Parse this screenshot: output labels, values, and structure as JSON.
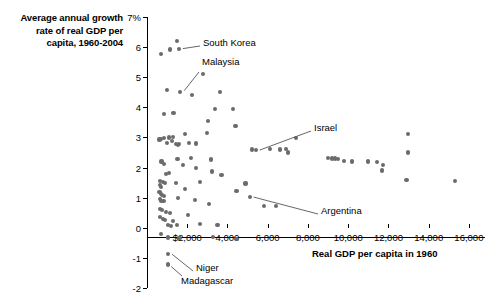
{
  "title": {
    "line1": "Average annual growth",
    "line2": "rate of real GDP per",
    "line3": "capita, 1960-2004"
  },
  "chart_data": {
    "type": "scatter",
    "title": "Average annual growth rate of real GDP per capita, 1960-2004",
    "xlabel": "Real GDP per capita in 1960",
    "ylabel": "Average annual growth rate of real GDP per capita, 1960-2004",
    "xlim": [
      0,
      16800
    ],
    "ylim": [
      -2,
      7
    ],
    "grid": false,
    "legend": null,
    "x_ticks": [
      2000,
      4000,
      6000,
      8000,
      10000,
      12000,
      14000,
      16000
    ],
    "x_tick_labels": [
      "$2,000",
      "4,000",
      "6,000",
      "8,000",
      "10,000",
      "12,000",
      "14,000",
      "16,000"
    ],
    "y_ticks": [
      -2,
      -1,
      0,
      1,
      2,
      3,
      4,
      5,
      6,
      7
    ],
    "y_tick_labels": [
      "-2",
      "-1",
      "0",
      "1",
      "2",
      "3",
      "4",
      "5",
      "6",
      "7%"
    ],
    "points": [
      {
        "x": 1500,
        "y": 6.2
      },
      {
        "x": 1580,
        "y": 5.95
      },
      {
        "x": 1160,
        "y": 5.92
      },
      {
        "x": 700,
        "y": 5.78
      },
      {
        "x": 2780,
        "y": 5.1
      },
      {
        "x": 3640,
        "y": 4.52
      },
      {
        "x": 1650,
        "y": 4.52
      },
      {
        "x": 1010,
        "y": 4.57
      },
      {
        "x": 2240,
        "y": 4.4
      },
      {
        "x": 4280,
        "y": 3.95
      },
      {
        "x": 3400,
        "y": 3.95
      },
      {
        "x": 1320,
        "y": 3.8
      },
      {
        "x": 860,
        "y": 3.77
      },
      {
        "x": 3050,
        "y": 3.55
      },
      {
        "x": 4400,
        "y": 3.38
      },
      {
        "x": 12980,
        "y": 3.12
      },
      {
        "x": 3000,
        "y": 3.14
      },
      {
        "x": 1900,
        "y": 3.12
      },
      {
        "x": 1080,
        "y": 3.0
      },
      {
        "x": 840,
        "y": 2.98
      },
      {
        "x": 700,
        "y": 2.95
      },
      {
        "x": 620,
        "y": 2.93
      },
      {
        "x": 1310,
        "y": 3.02
      },
      {
        "x": 1240,
        "y": 2.88
      },
      {
        "x": 1010,
        "y": 2.82
      },
      {
        "x": 1450,
        "y": 2.78
      },
      {
        "x": 1560,
        "y": 2.74
      },
      {
        "x": 1580,
        "y": 2.78
      },
      {
        "x": 2100,
        "y": 2.82
      },
      {
        "x": 2430,
        "y": 2.8
      },
      {
        "x": 12970,
        "y": 2.5
      },
      {
        "x": 7400,
        "y": 2.98
      },
      {
        "x": 6100,
        "y": 2.62
      },
      {
        "x": 6600,
        "y": 2.6
      },
      {
        "x": 6900,
        "y": 2.62
      },
      {
        "x": 7000,
        "y": 2.5
      },
      {
        "x": 5400,
        "y": 2.58
      },
      {
        "x": 5200,
        "y": 2.6
      },
      {
        "x": 9000,
        "y": 2.33
      },
      {
        "x": 9200,
        "y": 2.3
      },
      {
        "x": 9350,
        "y": 2.3
      },
      {
        "x": 9500,
        "y": 2.28
      },
      {
        "x": 9800,
        "y": 2.22
      },
      {
        "x": 10200,
        "y": 2.2
      },
      {
        "x": 11000,
        "y": 2.2
      },
      {
        "x": 11450,
        "y": 2.18
      },
      {
        "x": 11700,
        "y": 1.9
      },
      {
        "x": 11750,
        "y": 2.08
      },
      {
        "x": 15300,
        "y": 1.55
      },
      {
        "x": 12900,
        "y": 1.6
      },
      {
        "x": 2200,
        "y": 2.32
      },
      {
        "x": 3200,
        "y": 2.27
      },
      {
        "x": 1520,
        "y": 2.28
      },
      {
        "x": 720,
        "y": 2.2
      },
      {
        "x": 850,
        "y": 2.12
      },
      {
        "x": 1800,
        "y": 2.08
      },
      {
        "x": 2450,
        "y": 1.98
      },
      {
        "x": 3250,
        "y": 1.87
      },
      {
        "x": 3700,
        "y": 1.75
      },
      {
        "x": 950,
        "y": 1.78
      },
      {
        "x": 1100,
        "y": 1.82
      },
      {
        "x": 660,
        "y": 1.56
      },
      {
        "x": 780,
        "y": 1.52
      },
      {
        "x": 900,
        "y": 1.48
      },
      {
        "x": 640,
        "y": 1.42
      },
      {
        "x": 700,
        "y": 1.36
      },
      {
        "x": 1450,
        "y": 1.48
      },
      {
        "x": 1900,
        "y": 1.3
      },
      {
        "x": 2650,
        "y": 1.52
      },
      {
        "x": 4900,
        "y": 1.47
      },
      {
        "x": 4450,
        "y": 1.22
      },
      {
        "x": 5100,
        "y": 1.02
      },
      {
        "x": 620,
        "y": 1.2
      },
      {
        "x": 680,
        "y": 1.12
      },
      {
        "x": 760,
        "y": 1.1
      },
      {
        "x": 860,
        "y": 1.05
      },
      {
        "x": 640,
        "y": 0.95
      },
      {
        "x": 700,
        "y": 0.9
      },
      {
        "x": 820,
        "y": 0.88
      },
      {
        "x": 1550,
        "y": 1.0
      },
      {
        "x": 2400,
        "y": 0.92
      },
      {
        "x": 3100,
        "y": 0.78
      },
      {
        "x": 5800,
        "y": 0.72
      },
      {
        "x": 6400,
        "y": 0.72
      },
      {
        "x": 640,
        "y": 0.62
      },
      {
        "x": 740,
        "y": 0.58
      },
      {
        "x": 960,
        "y": 0.52
      },
      {
        "x": 1150,
        "y": 0.48
      },
      {
        "x": 660,
        "y": 0.35
      },
      {
        "x": 780,
        "y": 0.3
      },
      {
        "x": 900,
        "y": 0.25
      },
      {
        "x": 1300,
        "y": 0.22
      },
      {
        "x": 2050,
        "y": 0.42
      },
      {
        "x": 2650,
        "y": 0.12
      },
      {
        "x": 3500,
        "y": 0.1
      },
      {
        "x": 1050,
        "y": 0.1
      },
      {
        "x": 1180,
        "y": 0.05
      },
      {
        "x": 1500,
        "y": 0.08
      },
      {
        "x": 680,
        "y": -0.2
      },
      {
        "x": 1050,
        "y": -0.32
      },
      {
        "x": 1620,
        "y": -0.35
      },
      {
        "x": 3300,
        "y": -0.3
      },
      {
        "x": 4450,
        "y": -0.38
      },
      {
        "x": 1050,
        "y": -0.88
      },
      {
        "x": 1050,
        "y": -1.22
      }
    ],
    "annotations": [
      {
        "label": "South Korea",
        "point_x": 1580,
        "point_y": 5.95
      },
      {
        "label": "Malaysia",
        "point_x": 1650,
        "point_y": 4.52
      },
      {
        "label": "Israel",
        "point_x": 5400,
        "point_y": 2.58
      },
      {
        "label": "Argentina",
        "point_x": 5100,
        "point_y": 1.02
      },
      {
        "label": "Niger",
        "point_x": 1050,
        "point_y": -0.88
      },
      {
        "label": "Madagascar",
        "point_x": 1050,
        "point_y": -1.22
      }
    ]
  }
}
